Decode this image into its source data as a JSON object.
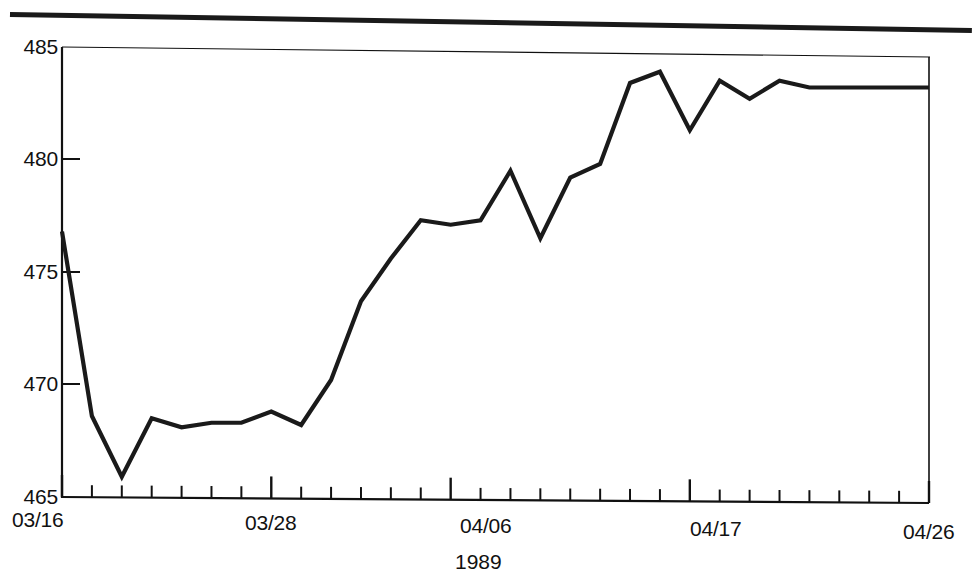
{
  "figure": {
    "has_top_rule": true,
    "background_color": "#ffffff",
    "ink_color": "#111111",
    "series_color": "#1a1a1a"
  },
  "chart_data": {
    "type": "line",
    "title": "",
    "subtitle": "",
    "xlabel": "1989",
    "ylabel": "",
    "ylim": [
      465,
      485
    ],
    "xlim": [
      "03/16",
      "04/26"
    ],
    "grid": false,
    "legend": null,
    "y_ticks": [
      465,
      470,
      475,
      480,
      485
    ],
    "y_tick_labels": [
      "465",
      "470",
      "475",
      "480",
      "485"
    ],
    "x_tick_labels": [
      "03/16",
      "03/28",
      "04/06",
      "04/17",
      "04/26"
    ],
    "x_tick_label_indices": [
      0,
      7,
      13,
      21,
      29
    ],
    "x_minor_tick_count": 30,
    "x": [
      "03/16",
      "03/17",
      "03/20",
      "03/21",
      "03/22",
      "03/23",
      "03/24",
      "03/28",
      "03/29",
      "03/30",
      "03/31",
      "04/03",
      "04/04",
      "04/06",
      "04/07",
      "04/10",
      "04/11",
      "04/12",
      "04/13",
      "04/14",
      "04/17",
      "04/18",
      "04/19",
      "04/20",
      "04/21",
      "04/24",
      "04/25",
      "04/26",
      "04/27",
      "04/28"
    ],
    "categories": [
      "03/16",
      "03/17",
      "03/20",
      "03/21",
      "03/22",
      "03/23",
      "03/24",
      "03/28",
      "03/29",
      "03/30",
      "03/31",
      "04/03",
      "04/04",
      "04/06",
      "04/07",
      "04/10",
      "04/11",
      "04/12",
      "04/13",
      "04/14",
      "04/17",
      "04/18",
      "04/19",
      "04/20",
      "04/21",
      "04/24",
      "04/25",
      "04/26",
      "04/27",
      "04/28"
    ],
    "values": [
      476.8,
      468.6,
      465.9,
      468.5,
      468.1,
      468.3,
      468.3,
      468.8,
      468.2,
      470.2,
      473.7,
      475.6,
      477.3,
      477.1,
      477.3,
      479.5,
      476.5,
      479.2,
      479.8,
      483.4,
      483.9,
      481.3,
      483.5,
      482.7,
      483.5,
      483.2,
      483.2,
      483.2,
      483.2,
      483.2
    ],
    "series": [
      {
        "name": "index",
        "values": [
          476.8,
          468.6,
          465.9,
          468.5,
          468.1,
          468.3,
          468.3,
          468.8,
          468.2,
          470.2,
          473.7,
          475.6,
          477.3,
          477.1,
          477.3,
          479.5,
          476.5,
          479.2,
          479.8,
          483.4,
          483.9,
          481.3,
          483.5,
          482.7,
          483.5,
          483.2,
          483.2,
          483.2,
          483.2,
          483.2
        ]
      }
    ],
    "point_count": 30,
    "min_value": 465.9,
    "max_value": 483.9
  },
  "axis": {
    "y_labels": [
      "485",
      "480",
      "475",
      "470",
      "465"
    ],
    "x_labels": [
      "03/16",
      "03/28",
      "04/06",
      "04/17",
      "04/26"
    ],
    "x_title": "1989"
  }
}
